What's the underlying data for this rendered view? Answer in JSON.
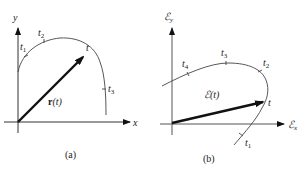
{
  "panel_a": {
    "caption": "(a)",
    "x_axis_label": "x",
    "y_axis_label": "y",
    "vector_label_bold": "r",
    "vector_label_arg": "(t)",
    "curve_points": {
      "t1": "t",
      "t1_sub": "1",
      "t2": "t",
      "t2_sub": "2",
      "t3": "t",
      "t3_sub": "3",
      "t": "t"
    }
  },
  "panel_b": {
    "caption": "(b)",
    "x_axis_label": "ℰ",
    "x_axis_sub": "x",
    "y_axis_label": "ℰ",
    "y_axis_sub": "y",
    "vector_label": "ℰ(t)",
    "curve_points": {
      "t1": "t",
      "t1_sub": "1",
      "t2": "t",
      "t2_sub": "2",
      "t3": "t",
      "t3_sub": "3",
      "t4": "t",
      "t4_sub": "4",
      "t": "t"
    }
  },
  "colors": {
    "line": "#333333",
    "vector": "#111111",
    "background": "#ffffff"
  }
}
